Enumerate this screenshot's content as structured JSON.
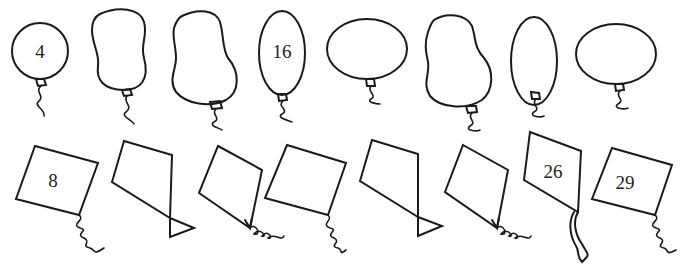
{
  "balloons": [
    {
      "label": "4",
      "shape": "circle"
    },
    {
      "label": "",
      "shape": "peanut"
    },
    {
      "label": "",
      "shape": "pear"
    },
    {
      "label": "16",
      "shape": "tall-oval"
    },
    {
      "label": "",
      "shape": "wide-oval"
    },
    {
      "label": "",
      "shape": "pear"
    },
    {
      "label": "",
      "shape": "tall-oval"
    },
    {
      "label": "",
      "shape": "wide-oval"
    }
  ],
  "kites": [
    {
      "label": "8",
      "tail": "curly"
    },
    {
      "label": "",
      "tail": "bow"
    },
    {
      "label": "",
      "tail": "curly"
    },
    {
      "label": "",
      "tail": "curly"
    },
    {
      "label": "",
      "tail": "bow"
    },
    {
      "label": "",
      "tail": "curly"
    },
    {
      "label": "26",
      "tail": "ribbon"
    },
    {
      "label": "29",
      "tail": "curly"
    }
  ],
  "colors": {
    "stroke": "#1a1a1a",
    "background": "#ffffff"
  }
}
